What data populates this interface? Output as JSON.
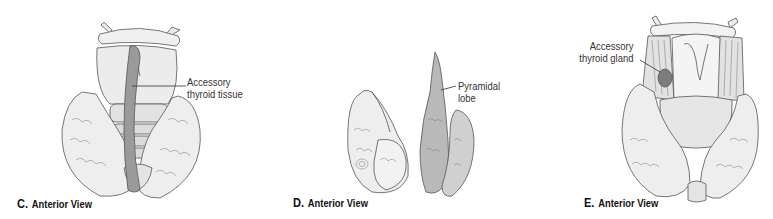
{
  "figure": {
    "panels": [
      {
        "id": "C",
        "letter": "C.",
        "view": "Anterior View",
        "callouts": [
          {
            "line1": "Accessory",
            "line2": "thyroid tissue"
          }
        ]
      },
      {
        "id": "D",
        "letter": "D.",
        "view": "Anterior View",
        "callouts": [
          {
            "line1": "Pyramidal",
            "line2": "lobe"
          }
        ]
      },
      {
        "id": "E",
        "letter": "E.",
        "view": "Anterior View",
        "callouts": [
          {
            "line1": "Accessory",
            "line2": "thyroid gland"
          }
        ]
      }
    ],
    "colors": {
      "background": "#ffffff",
      "outline": "#555555",
      "tissue_light": "#e6e6e6",
      "tissue_mid": "#bdbdbd",
      "tissue_dark": "#8a8a8a",
      "text": "#222222"
    }
  }
}
